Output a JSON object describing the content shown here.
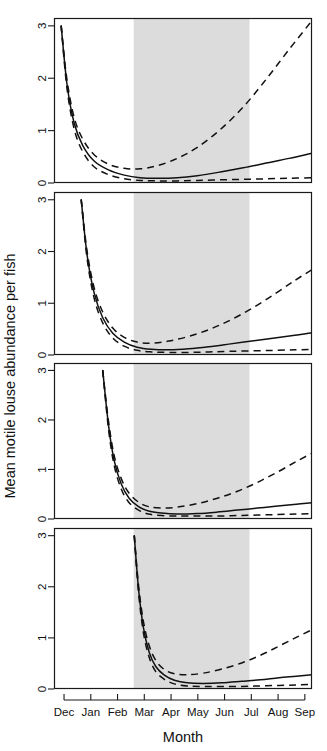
{
  "figure": {
    "width": 327,
    "height": 751,
    "background_color": "#ffffff",
    "line_color": "#111111",
    "shade_color": "#dcdcdc"
  },
  "chart_data": {
    "type": "line",
    "title": "",
    "subtitle": "",
    "xlabel": "Month",
    "ylabel": "Mean motile louse abundance per fish",
    "n_panels": 4,
    "panel_layout": "4 stacked panels sharing one x-axis",
    "grid": false,
    "legend": null,
    "x_categories": [
      "Dec",
      "Jan",
      "Feb",
      "Mar",
      "Apr",
      "May",
      "Jun",
      "Jul",
      "Aug",
      "Sep"
    ],
    "x_tick_labels": [
      "Dec",
      "Jan",
      "Feb",
      "Mar",
      "Apr",
      "May",
      "Jun",
      "Jul",
      "Aug",
      "Sep"
    ],
    "xlim": [
      0,
      9
    ],
    "y_tick_labels": [
      "0",
      "1",
      "2",
      "3"
    ],
    "y_ticks": [
      0,
      1,
      2,
      3
    ],
    "ylim": [
      0,
      3.15
    ],
    "shaded_region": {
      "label": "",
      "x_start_month": "Mar",
      "x_end_month": "Jul",
      "x_start": 2.78,
      "x_end": 6.82,
      "color": "#dcdcdc"
    },
    "panels": [
      {
        "index": 1,
        "name": "panel-1",
        "start_x": 0.25,
        "series": [
          {
            "name": "fit",
            "style": "solid",
            "x": [
              0.25,
              0.45,
              0.7,
              1.0,
              1.4,
              1.9,
              2.45,
              3.0,
              3.6,
              4.3,
              5.0,
              5.8,
              6.6,
              7.4,
              8.2,
              9.0
            ],
            "values": [
              3.0,
              1.9,
              1.15,
              0.72,
              0.42,
              0.25,
              0.15,
              0.1,
              0.09,
              0.1,
              0.14,
              0.21,
              0.29,
              0.38,
              0.47,
              0.57
            ]
          },
          {
            "name": "upper-ci",
            "style": "dashed",
            "x": [
              0.25,
              0.45,
              0.7,
              1.0,
              1.4,
              1.9,
              2.45,
              3.0,
              3.6,
              4.3,
              5.0,
              5.8,
              6.6,
              7.4,
              8.2,
              9.0
            ],
            "values": [
              3.0,
              1.98,
              1.26,
              0.84,
              0.54,
              0.36,
              0.28,
              0.27,
              0.33,
              0.47,
              0.68,
              1.02,
              1.45,
              1.98,
              2.55,
              3.1
            ]
          },
          {
            "name": "lower-ci",
            "style": "dashed",
            "x": [
              0.25,
              0.45,
              0.7,
              1.0,
              1.4,
              1.9,
              2.45,
              3.0,
              3.6,
              4.3,
              5.0,
              5.8,
              6.6,
              7.4,
              8.2,
              9.0
            ],
            "values": [
              3.0,
              1.82,
              1.04,
              0.6,
              0.31,
              0.16,
              0.08,
              0.05,
              0.04,
              0.04,
              0.05,
              0.06,
              0.07,
              0.08,
              0.09,
              0.1
            ]
          }
        ]
      },
      {
        "index": 2,
        "name": "panel-2",
        "start_x": 0.95,
        "series": [
          {
            "name": "fit",
            "style": "solid",
            "x": [
              0.95,
              1.15,
              1.4,
              1.7,
              2.05,
              2.45,
              2.9,
              3.4,
              4.0,
              4.7,
              5.4,
              6.1,
              6.9,
              7.7,
              8.4,
              9.0
            ],
            "values": [
              3.0,
              1.95,
              1.2,
              0.72,
              0.42,
              0.25,
              0.15,
              0.11,
              0.1,
              0.12,
              0.16,
              0.21,
              0.27,
              0.33,
              0.38,
              0.43
            ]
          },
          {
            "name": "upper-ci",
            "style": "dashed",
            "x": [
              0.95,
              1.15,
              1.4,
              1.7,
              2.05,
              2.45,
              2.9,
              3.4,
              4.0,
              4.7,
              5.4,
              6.1,
              6.9,
              7.7,
              8.4,
              9.0
            ],
            "values": [
              3.0,
              2.02,
              1.3,
              0.83,
              0.52,
              0.34,
              0.25,
              0.23,
              0.27,
              0.36,
              0.49,
              0.66,
              0.9,
              1.18,
              1.44,
              1.65
            ]
          },
          {
            "name": "lower-ci",
            "style": "dashed",
            "x": [
              0.95,
              1.15,
              1.4,
              1.7,
              2.05,
              2.45,
              2.9,
              3.4,
              4.0,
              4.7,
              5.4,
              6.1,
              6.9,
              7.7,
              8.4,
              9.0
            ],
            "values": [
              3.0,
              1.88,
              1.1,
              0.62,
              0.33,
              0.17,
              0.09,
              0.06,
              0.05,
              0.05,
              0.06,
              0.07,
              0.08,
              0.09,
              0.1,
              0.11
            ]
          }
        ]
      },
      {
        "index": 3,
        "name": "panel-3",
        "start_x": 1.7,
        "series": [
          {
            "name": "fit",
            "style": "solid",
            "x": [
              1.7,
              1.9,
              2.1,
              2.35,
              2.62,
              2.95,
              3.3,
              3.75,
              4.3,
              5.0,
              5.7,
              6.4,
              7.1,
              7.8,
              8.45,
              9.0
            ],
            "values": [
              3.0,
              1.9,
              1.18,
              0.7,
              0.42,
              0.25,
              0.16,
              0.12,
              0.1,
              0.11,
              0.14,
              0.18,
              0.22,
              0.26,
              0.3,
              0.33
            ]
          },
          {
            "name": "upper-ci",
            "style": "dashed",
            "x": [
              1.7,
              1.9,
              2.1,
              2.35,
              2.62,
              2.95,
              3.3,
              3.75,
              4.3,
              5.0,
              5.7,
              6.4,
              7.1,
              7.8,
              8.45,
              9.0
            ],
            "values": [
              3.0,
              1.98,
              1.28,
              0.81,
              0.52,
              0.34,
              0.25,
              0.22,
              0.24,
              0.31,
              0.42,
              0.56,
              0.74,
              0.95,
              1.16,
              1.33
            ]
          },
          {
            "name": "lower-ci",
            "style": "dashed",
            "x": [
              1.7,
              1.9,
              2.1,
              2.35,
              2.62,
              2.95,
              3.3,
              3.75,
              4.3,
              5.0,
              5.7,
              6.4,
              7.1,
              7.8,
              8.45,
              9.0
            ],
            "values": [
              3.0,
              1.82,
              1.08,
              0.6,
              0.33,
              0.18,
              0.1,
              0.07,
              0.06,
              0.06,
              0.06,
              0.07,
              0.08,
              0.09,
              0.1,
              0.11
            ]
          }
        ]
      },
      {
        "index": 4,
        "name": "panel-4",
        "start_x": 2.8,
        "series": [
          {
            "name": "fit",
            "style": "solid",
            "x": [
              2.8,
              2.95,
              3.12,
              3.32,
              3.55,
              3.85,
              4.2,
              4.65,
              5.2,
              5.85,
              6.55,
              7.2,
              7.85,
              8.45,
              9.0
            ],
            "values": [
              3.0,
              1.95,
              1.2,
              0.72,
              0.44,
              0.27,
              0.17,
              0.12,
              0.11,
              0.12,
              0.15,
              0.18,
              0.22,
              0.25,
              0.28
            ]
          },
          {
            "name": "upper-ci",
            "style": "dashed",
            "x": [
              2.8,
              2.95,
              3.12,
              3.32,
              3.55,
              3.85,
              4.2,
              4.65,
              5.2,
              5.85,
              6.55,
              7.2,
              7.85,
              8.45,
              9.0
            ],
            "values": [
              3.0,
              2.02,
              1.32,
              0.85,
              0.56,
              0.38,
              0.3,
              0.28,
              0.31,
              0.39,
              0.51,
              0.66,
              0.84,
              1.01,
              1.16
            ]
          },
          {
            "name": "lower-ci",
            "style": "dashed",
            "x": [
              2.8,
              2.95,
              3.12,
              3.32,
              3.55,
              3.85,
              4.2,
              4.65,
              5.2,
              5.85,
              6.55,
              7.2,
              7.85,
              8.45,
              9.0
            ],
            "values": [
              3.0,
              1.88,
              1.1,
              0.62,
              0.34,
              0.19,
              0.1,
              0.06,
              0.05,
              0.05,
              0.05,
              0.06,
              0.07,
              0.08,
              0.09
            ]
          }
        ]
      }
    ]
  }
}
